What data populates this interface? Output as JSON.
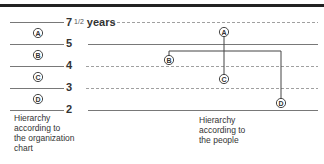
{
  "diagram": {
    "levels": [
      {
        "id": "lvl-7half",
        "label_main": "7",
        "label_frac": "1/2",
        "label_suffix": " years",
        "y": 22,
        "left_style": "solid",
        "right_style": "dashed",
        "right_start": 112
      },
      {
        "id": "lvl-5",
        "label_main": "5",
        "label_frac": "",
        "label_suffix": "",
        "y": 44,
        "left_style": "solid",
        "right_style": "solid",
        "right_start": 88
      },
      {
        "id": "lvl-4",
        "label_main": "4",
        "label_frac": "",
        "label_suffix": "",
        "y": 66,
        "left_style": "solid",
        "right_style": "dashed",
        "right_start": 86
      },
      {
        "id": "lvl-3",
        "label_main": "3",
        "label_frac": "",
        "label_suffix": "",
        "y": 88,
        "left_style": "solid",
        "right_style": "dashed",
        "right_start": 86
      },
      {
        "id": "lvl-2",
        "label_main": "2",
        "label_frac": "",
        "label_suffix": "",
        "y": 110,
        "left_style": "solid",
        "right_style": "solid",
        "right_start": 88
      }
    ],
    "org_chart_nodes": [
      {
        "label": "A",
        "x": 38,
        "y": 33
      },
      {
        "label": "B",
        "x": 38,
        "y": 55
      },
      {
        "label": "C",
        "x": 38,
        "y": 77
      },
      {
        "label": "D",
        "x": 38,
        "y": 99
      }
    ],
    "people_nodes": [
      {
        "label": "A",
        "x": 224,
        "y": 32
      },
      {
        "label": "B",
        "x": 169,
        "y": 60
      },
      {
        "label": "C",
        "x": 224,
        "y": 79
      },
      {
        "label": "D",
        "x": 281,
        "y": 103
      }
    ],
    "connectors": {
      "a_to_c": {
        "x": 224,
        "y1": 36,
        "y2": 75
      },
      "bracket": {
        "y": 51,
        "x1": 169,
        "x2": 281,
        "b_y": 56,
        "d_y": 99
      }
    },
    "captions": {
      "left": "Hierarchy\naccording to\nthe organization\nchart",
      "right": "Hierarchy\naccording to\nthe people"
    },
    "colors": {
      "rule": "#222222",
      "line": "#555555",
      "dashed": "#888888",
      "connector": "#444444",
      "text": "#333333"
    }
  }
}
